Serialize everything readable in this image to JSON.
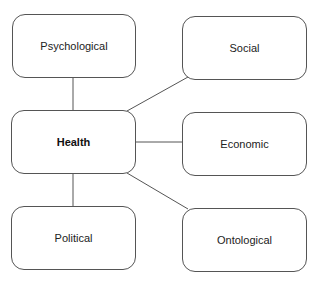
{
  "diagram": {
    "center": {
      "id": "health",
      "label": "Health",
      "x": 11,
      "y": 110,
      "w": 125,
      "h": 64
    },
    "nodes": [
      {
        "id": "psychological",
        "label": "Psychological",
        "x": 12,
        "y": 14,
        "w": 124,
        "h": 64
      },
      {
        "id": "social",
        "label": "Social",
        "x": 182,
        "y": 16,
        "w": 125,
        "h": 64
      },
      {
        "id": "economic",
        "label": "Economic",
        "x": 182,
        "y": 112,
        "w": 125,
        "h": 64
      },
      {
        "id": "political",
        "label": "Political",
        "x": 11,
        "y": 206,
        "w": 125,
        "h": 64
      },
      {
        "id": "ontological",
        "label": "Ontological",
        "x": 182,
        "y": 208,
        "w": 125,
        "h": 64
      }
    ],
    "edges": [
      {
        "from": "health",
        "to": "psychological"
      },
      {
        "from": "health",
        "to": "social"
      },
      {
        "from": "health",
        "to": "economic"
      },
      {
        "from": "health",
        "to": "political"
      },
      {
        "from": "health",
        "to": "ontological"
      }
    ],
    "colors": {
      "stroke": "#555555",
      "text": "#222222",
      "background": "#ffffff"
    }
  }
}
